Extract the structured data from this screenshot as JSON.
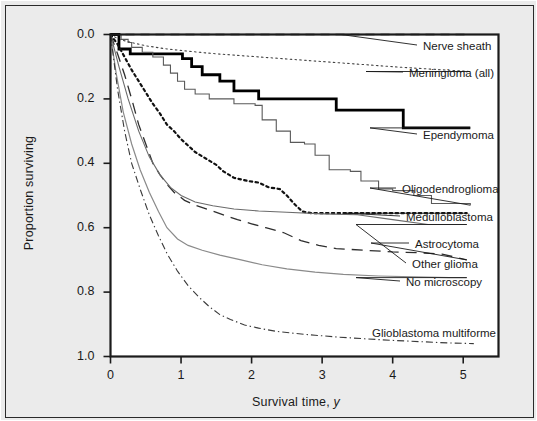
{
  "figure": {
    "background_color": "#ebebeb",
    "plot_background_color": "#ffffff",
    "border_color": "#2a2a2a"
  },
  "axes": {
    "ylabel": "Proportion surviving",
    "xlabel_main": "Survival time,",
    "xlabel_unit": "y",
    "yticks": [
      "1.0",
      "0.8",
      "0.6",
      "0.4",
      "0.2",
      "0.0"
    ],
    "xticks": [
      "0",
      "1",
      "2",
      "3",
      "4",
      "5"
    ]
  },
  "chart_data": {
    "type": "line",
    "title": "",
    "xlabel": "Survival time, y",
    "ylabel": "Proportion surviving",
    "xlim": [
      0,
      5.5
    ],
    "ylim": [
      0.0,
      1.0
    ],
    "xticks": [
      0,
      1,
      2,
      3,
      4,
      5
    ],
    "yticks": [
      0.0,
      0.2,
      0.4,
      0.6,
      0.8,
      1.0
    ],
    "grid": false,
    "legend_position": "right-annotations",
    "series": [
      {
        "name": "Nerve sheath",
        "style": "dashed",
        "color": "#333333",
        "width": 1.3,
        "label_y": 1.0,
        "points": [
          [
            0,
            1.0
          ],
          [
            0.1,
            1.0
          ],
          [
            5.1,
            1.0
          ]
        ]
      },
      {
        "name": "Meningioma (all)",
        "style": "fine-dotted",
        "color": "#444444",
        "width": 1.1,
        "label_y": 0.885,
        "points": [
          [
            0,
            1.0
          ],
          [
            0.12,
            0.985
          ],
          [
            0.3,
            0.975
          ],
          [
            0.5,
            0.965
          ],
          [
            0.8,
            0.955
          ],
          [
            1.1,
            0.948
          ],
          [
            1.5,
            0.94
          ],
          [
            2.0,
            0.932
          ],
          [
            2.5,
            0.924
          ],
          [
            3.0,
            0.916
          ],
          [
            3.5,
            0.908
          ],
          [
            4.0,
            0.9
          ],
          [
            4.5,
            0.893
          ],
          [
            5.1,
            0.885
          ]
        ]
      },
      {
        "name": "Ependymoma",
        "style": "solid-thick-step",
        "color": "#000000",
        "width": 2.8,
        "label_y": 0.71,
        "points": [
          [
            0,
            1.0
          ],
          [
            0.12,
            1.0
          ],
          [
            0.12,
            0.955
          ],
          [
            0.28,
            0.955
          ],
          [
            0.28,
            0.94
          ],
          [
            1.02,
            0.94
          ],
          [
            1.02,
            0.925
          ],
          [
            1.15,
            0.925
          ],
          [
            1.15,
            0.9
          ],
          [
            1.3,
            0.9
          ],
          [
            1.3,
            0.875
          ],
          [
            1.55,
            0.875
          ],
          [
            1.55,
            0.855
          ],
          [
            1.75,
            0.855
          ],
          [
            1.75,
            0.825
          ],
          [
            2.1,
            0.825
          ],
          [
            2.1,
            0.8
          ],
          [
            3.2,
            0.8
          ],
          [
            3.2,
            0.765
          ],
          [
            4.15,
            0.765
          ],
          [
            4.15,
            0.71
          ],
          [
            5.1,
            0.71
          ]
        ]
      },
      {
        "name": "Oligodendroglioma",
        "style": "solid-thin-step",
        "color": "#5a5a5a",
        "width": 1.1,
        "label_y": 0.47,
        "points": [
          [
            0,
            1.0
          ],
          [
            0.15,
            0.985
          ],
          [
            0.25,
            0.975
          ],
          [
            0.3,
            0.96
          ],
          [
            0.45,
            0.945
          ],
          [
            0.6,
            0.93
          ],
          [
            0.75,
            0.905
          ],
          [
            0.85,
            0.88
          ],
          [
            0.95,
            0.855
          ],
          [
            1.05,
            0.83
          ],
          [
            1.2,
            0.815
          ],
          [
            1.4,
            0.8
          ],
          [
            1.75,
            0.785
          ],
          [
            2.05,
            0.78
          ],
          [
            2.15,
            0.735
          ],
          [
            2.35,
            0.7
          ],
          [
            2.55,
            0.665
          ],
          [
            2.75,
            0.66
          ],
          [
            2.9,
            0.625
          ],
          [
            3.1,
            0.58
          ],
          [
            3.4,
            0.575
          ],
          [
            3.55,
            0.545
          ],
          [
            3.8,
            0.52
          ],
          [
            4.0,
            0.515
          ],
          [
            4.3,
            0.5
          ],
          [
            4.55,
            0.475
          ],
          [
            5.1,
            0.47
          ]
        ]
      },
      {
        "name": "Medulloblastoma",
        "style": "heavy-dotted",
        "color": "#111111",
        "width": 2.2,
        "label_y": 0.445,
        "points": [
          [
            0,
            1.0
          ],
          [
            0.1,
            0.97
          ],
          [
            0.2,
            0.93
          ],
          [
            0.3,
            0.89
          ],
          [
            0.4,
            0.855
          ],
          [
            0.5,
            0.82
          ],
          [
            0.6,
            0.785
          ],
          [
            0.7,
            0.755
          ],
          [
            0.8,
            0.72
          ],
          [
            0.9,
            0.7
          ],
          [
            1.0,
            0.675
          ],
          [
            1.1,
            0.655
          ],
          [
            1.2,
            0.635
          ],
          [
            1.35,
            0.615
          ],
          [
            1.5,
            0.595
          ],
          [
            1.6,
            0.575
          ],
          [
            1.75,
            0.555
          ],
          [
            1.95,
            0.545
          ],
          [
            2.1,
            0.54
          ],
          [
            2.25,
            0.525
          ],
          [
            2.4,
            0.52
          ],
          [
            2.5,
            0.5
          ],
          [
            2.6,
            0.475
          ],
          [
            2.72,
            0.45
          ],
          [
            2.85,
            0.445
          ],
          [
            3.5,
            0.445
          ],
          [
            4.3,
            0.445
          ],
          [
            5.05,
            0.445
          ]
        ]
      },
      {
        "name": "Astrocytoma",
        "style": "long-dashed",
        "color": "#2e2e2e",
        "width": 1.3,
        "label_y": 0.3,
        "points": [
          [
            0,
            1.0
          ],
          [
            0.1,
            0.94
          ],
          [
            0.2,
            0.875
          ],
          [
            0.3,
            0.8
          ],
          [
            0.4,
            0.72
          ],
          [
            0.5,
            0.66
          ],
          [
            0.6,
            0.6
          ],
          [
            0.7,
            0.565
          ],
          [
            0.8,
            0.535
          ],
          [
            0.9,
            0.51
          ],
          [
            1.05,
            0.485
          ],
          [
            1.2,
            0.47
          ],
          [
            1.4,
            0.455
          ],
          [
            1.6,
            0.44
          ],
          [
            1.8,
            0.425
          ],
          [
            2.0,
            0.412
          ],
          [
            2.2,
            0.4
          ],
          [
            2.45,
            0.385
          ],
          [
            2.7,
            0.36
          ],
          [
            2.95,
            0.345
          ],
          [
            3.2,
            0.335
          ],
          [
            3.6,
            0.33
          ],
          [
            4.0,
            0.325
          ],
          [
            4.4,
            0.322
          ],
          [
            4.7,
            0.318
          ],
          [
            5.05,
            0.3
          ]
        ]
      },
      {
        "name": "Other glioma",
        "style": "solid-thin",
        "color": "#6b6b6b",
        "width": 1.1,
        "label_y": 0.41,
        "points": [
          [
            0,
            1.0
          ],
          [
            0.12,
            0.9
          ],
          [
            0.25,
            0.8
          ],
          [
            0.4,
            0.7
          ],
          [
            0.55,
            0.62
          ],
          [
            0.7,
            0.565
          ],
          [
            0.85,
            0.525
          ],
          [
            1.0,
            0.5
          ],
          [
            1.2,
            0.48
          ],
          [
            1.45,
            0.468
          ],
          [
            1.75,
            0.458
          ],
          [
            2.1,
            0.452
          ],
          [
            2.5,
            0.448
          ],
          [
            3.0,
            0.443
          ],
          [
            3.5,
            0.44
          ],
          [
            4.0,
            0.425
          ],
          [
            4.5,
            0.41
          ],
          [
            5.05,
            0.41
          ]
        ]
      },
      {
        "name": "No microscopy",
        "style": "solid-thin-light",
        "color": "#8a8a8a",
        "width": 1.2,
        "label_y": 0.245,
        "points": [
          [
            0,
            1.0
          ],
          [
            0.08,
            0.88
          ],
          [
            0.18,
            0.76
          ],
          [
            0.3,
            0.66
          ],
          [
            0.42,
            0.58
          ],
          [
            0.55,
            0.51
          ],
          [
            0.68,
            0.45
          ],
          [
            0.8,
            0.4
          ],
          [
            0.95,
            0.365
          ],
          [
            1.1,
            0.345
          ],
          [
            1.3,
            0.33
          ],
          [
            1.55,
            0.315
          ],
          [
            1.85,
            0.3
          ],
          [
            2.15,
            0.285
          ],
          [
            2.5,
            0.272
          ],
          [
            2.9,
            0.262
          ],
          [
            3.3,
            0.255
          ],
          [
            3.8,
            0.25
          ],
          [
            4.3,
            0.247
          ],
          [
            4.8,
            0.245
          ],
          [
            5.05,
            0.245
          ]
        ]
      },
      {
        "name": "Glioblastoma multiforme",
        "style": "dash-dot",
        "color": "#3a3a3a",
        "width": 1.1,
        "label_y": 0.04,
        "points": [
          [
            0,
            1.0
          ],
          [
            0.1,
            0.83
          ],
          [
            0.2,
            0.7
          ],
          [
            0.3,
            0.6
          ],
          [
            0.42,
            0.52
          ],
          [
            0.55,
            0.44
          ],
          [
            0.68,
            0.375
          ],
          [
            0.8,
            0.32
          ],
          [
            0.95,
            0.265
          ],
          [
            1.1,
            0.22
          ],
          [
            1.25,
            0.185
          ],
          [
            1.4,
            0.155
          ],
          [
            1.55,
            0.13
          ],
          [
            1.7,
            0.115
          ],
          [
            1.9,
            0.098
          ],
          [
            2.1,
            0.088
          ],
          [
            2.35,
            0.078
          ],
          [
            2.6,
            0.072
          ],
          [
            2.9,
            0.066
          ],
          [
            3.25,
            0.06
          ],
          [
            3.6,
            0.055
          ],
          [
            4.0,
            0.05
          ],
          [
            4.4,
            0.046
          ],
          [
            4.8,
            0.042
          ],
          [
            5.15,
            0.04
          ]
        ]
      }
    ]
  },
  "annotations": [
    {
      "name": "Nerve sheath",
      "label_x": 422,
      "label_y": 47,
      "anchor_x": 340,
      "anchor_y": 44.5,
      "elbow": false
    },
    {
      "name": "Meningioma (all)",
      "label_x": 408,
      "label_y": 74,
      "anchor_x": 365,
      "anchor_y": 71.5,
      "elbow": false
    },
    {
      "name": "Ependymoma",
      "label_x": 422,
      "label_y": 136,
      "anchor_x": 369,
      "anchor_y": 133.5,
      "elbow": false
    },
    {
      "name": "Oligodendroglioma",
      "label_x": 401,
      "label_y": 190,
      "anchor_x": 369,
      "anchor_y": 187.5,
      "elbow": true
    },
    {
      "name": "Medulloblastoma",
      "label_x": 405,
      "label_y": 218,
      "anchor_x": 345,
      "anchor_y": 215.5,
      "elbow": false
    },
    {
      "name": "Astrocytoma",
      "label_x": 414,
      "label_y": 245,
      "anchor_x": 370,
      "anchor_y": 242.5,
      "elbow": true
    },
    {
      "name": "Other glioma",
      "label_x": 411,
      "label_y": 265,
      "anchor_x": 355,
      "anchor_y": 262.5,
      "elbow": false
    },
    {
      "name": "No microscopy",
      "label_x": 405,
      "label_y": 283,
      "anchor_x": 355,
      "anchor_y": 280.5,
      "elbow": false
    },
    {
      "name": "Glioblastoma multiforme",
      "label_x": 371,
      "label_y": 334,
      "anchor_x": 0,
      "anchor_y": 0,
      "elbow": false
    }
  ]
}
